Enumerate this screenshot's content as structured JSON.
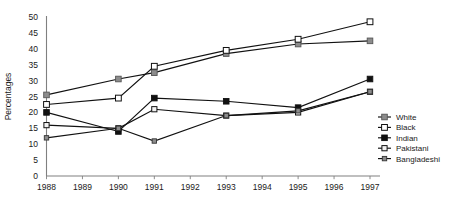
{
  "chart_data": {
    "type": "line",
    "title": "",
    "subtitle": "",
    "xlabel": "",
    "ylabel": "Percentages",
    "x": [
      1988,
      1989,
      1990,
      1991,
      1992,
      1993,
      1994,
      1995,
      1996,
      1997
    ],
    "xtick_labels": [
      "1988",
      "1989",
      "1990",
      "1991",
      "1992",
      "1993",
      "1994",
      "1995",
      "1996",
      "1997"
    ],
    "ytick_labels": [
      "0",
      "5",
      "10",
      "15",
      "20",
      "25",
      "30",
      "35",
      "40",
      "45",
      "50"
    ],
    "yticks": [
      0,
      5,
      10,
      15,
      20,
      25,
      30,
      35,
      40,
      45,
      50
    ],
    "ylim": [
      0,
      50
    ],
    "xlim": [
      1988,
      1997
    ],
    "grid": false,
    "legend_position": "right",
    "series": [
      {
        "name": "White",
        "marker": "square-filled-gray",
        "marker_color": "#8c8c8c",
        "line_color": "#111111",
        "x": [
          1988,
          1990,
          1991,
          1993,
          1995,
          1997
        ],
        "values": [
          25.5,
          30.5,
          32.5,
          38.5,
          41.5,
          42.5
        ]
      },
      {
        "name": "Black",
        "marker": "square-open-white",
        "marker_color": "#ffffff",
        "line_color": "#111111",
        "x": [
          1988,
          1990,
          1991,
          1993,
          1995,
          1997
        ],
        "values": [
          22.5,
          24.5,
          34.5,
          39.5,
          43.0,
          48.5
        ]
      },
      {
        "name": "Indian",
        "marker": "square-filled-black",
        "marker_color": "#111111",
        "line_color": "#111111",
        "x": [
          1988,
          1990,
          1991,
          1993,
          1995,
          1997
        ],
        "values": [
          20.0,
          14.0,
          24.5,
          23.5,
          21.5,
          30.5
        ]
      },
      {
        "name": "Pakistani",
        "marker": "square-open-light",
        "marker_color": "#f2f2f2",
        "line_color": "#111111",
        "x": [
          1988,
          1990,
          1991,
          1993,
          1995,
          1997
        ],
        "values": [
          16.0,
          15.0,
          21.0,
          19.0,
          20.0,
          26.5
        ]
      },
      {
        "name": "Bangladeshi",
        "marker": "square-small-gray",
        "marker_color": "#8c8c8c",
        "line_color": "#111111",
        "x": [
          1988,
          1990,
          1991,
          1993,
          1995,
          1997
        ],
        "values": [
          12.0,
          15.0,
          11.0,
          19.0,
          20.5,
          26.5
        ]
      }
    ]
  },
  "legend": {
    "items": [
      {
        "label": "White"
      },
      {
        "label": "Black"
      },
      {
        "label": "Indian"
      },
      {
        "label": "Pakistani"
      },
      {
        "label": "Bangladeshi"
      }
    ]
  },
  "colors": {
    "line": "#111111",
    "axis": "#808080",
    "gray_marker": "#8c8c8c",
    "black_marker": "#111111",
    "open_marker": "#ffffff",
    "light_marker": "#f2f2f2",
    "background": "#ffffff"
  }
}
